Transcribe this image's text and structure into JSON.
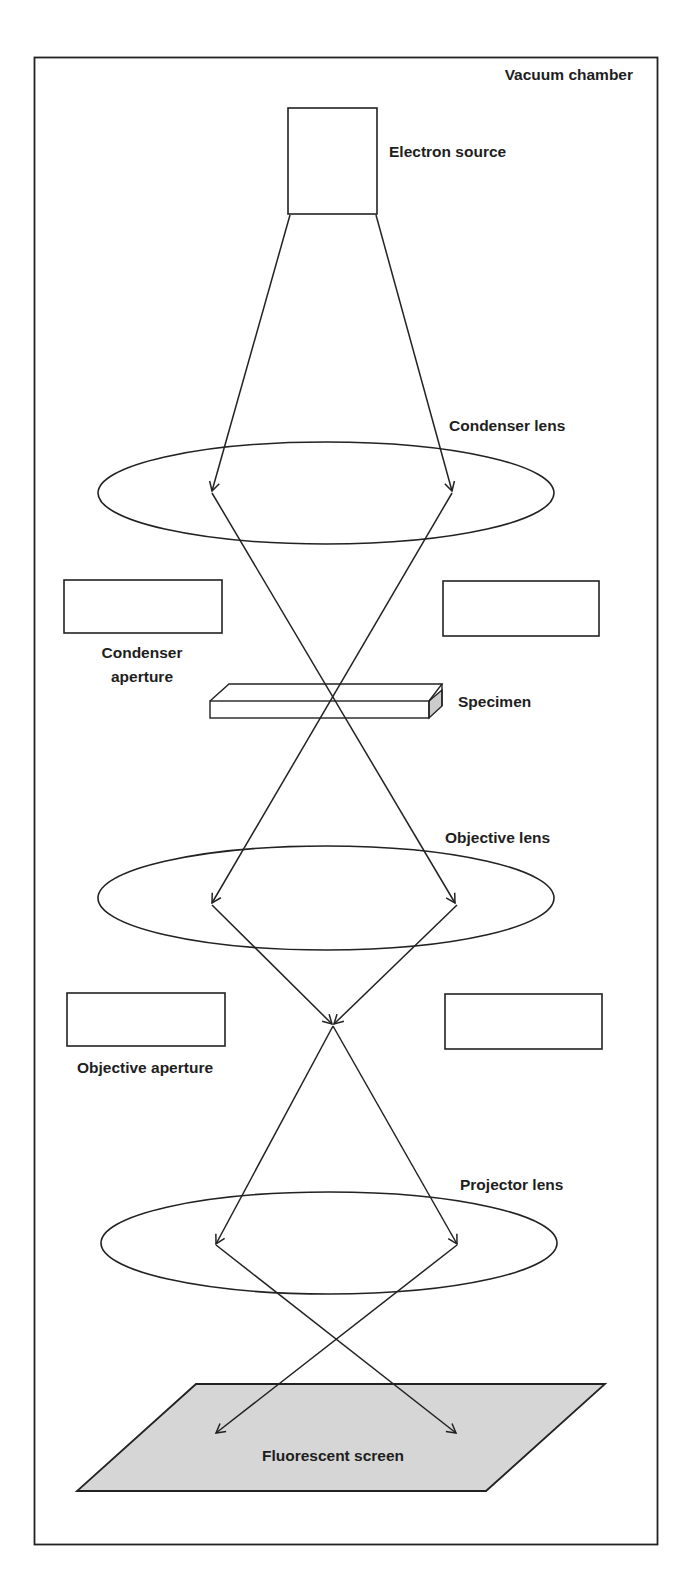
{
  "diagram": {
    "colors": {
      "line": "#222222",
      "screen_fill": "#d6d6d6",
      "specimen_side_fill": "#cccccc",
      "background": "#ffffff"
    },
    "labels": {
      "vacuum_chamber": "Vacuum chamber",
      "electron_source": "Electron source",
      "condenser_lens": "Condenser lens",
      "condenser_aperture_line1": "Condenser",
      "condenser_aperture_line2": "aperture",
      "specimen": "Specimen",
      "objective_lens": "Objective lens",
      "objective_aperture": "Objective aperture",
      "projector_lens": "Projector lens",
      "fluorescent_screen": "Fluorescent screen"
    },
    "components_top_to_bottom": [
      "Electron source",
      "Condenser lens",
      "Condenser aperture",
      "Specimen",
      "Objective lens",
      "Objective aperture",
      "Projector lens",
      "Fluorescent screen"
    ]
  }
}
